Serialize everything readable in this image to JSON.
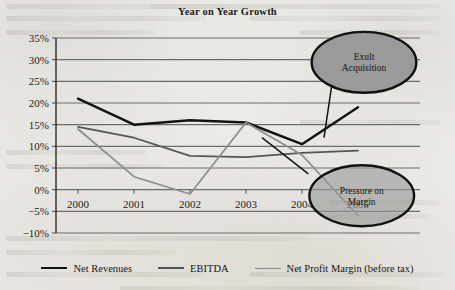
{
  "chart_data": {
    "type": "line",
    "title": "Year on Year Growth",
    "xlabel": "",
    "ylabel": "",
    "categories": [
      "2000",
      "2001",
      "2002",
      "2003",
      "2004",
      "2005"
    ],
    "ylim": [
      -10,
      35
    ],
    "ytick_labels": [
      "35%",
      "30%",
      "25%",
      "20%",
      "15%",
      "10%",
      "5%",
      "0%",
      "-5%",
      "-10%"
    ],
    "ytick_values": [
      35,
      30,
      25,
      20,
      15,
      10,
      5,
      0,
      -5,
      -10
    ],
    "ytick_step": 5,
    "grid": true,
    "legend_position": "bottom",
    "series": [
      {
        "name": "Net Revenues",
        "color": "#141414",
        "values": [
          21.0,
          15.0,
          16.0,
          15.5,
          10.5,
          19.0
        ]
      },
      {
        "name": "EBITDA",
        "color": "#555555",
        "values": [
          14.5,
          12.0,
          7.8,
          7.5,
          8.5,
          9.0
        ]
      },
      {
        "name": "Net Profit Margin (before tax)",
        "color": "#8d8d8d",
        "values": [
          14.0,
          3.0,
          -1.0,
          15.5,
          8.0,
          -6.0
        ]
      }
    ],
    "annotations": [
      {
        "id": "exult-acquisition",
        "lines": [
          "Exult",
          "Acquisition"
        ],
        "style": "solid",
        "center_pct": {
          "x": 0.8,
          "y": 0.215
        },
        "radius_pct": {
          "x": 0.115,
          "y": 0.105
        }
      },
      {
        "id": "pressure-on-margin",
        "lines": [
          "Pressure on",
          "Margin"
        ],
        "style": "translucent",
        "center_pct": {
          "x": 0.795,
          "y": 0.675
        },
        "radius_pct": {
          "x": 0.115,
          "y": 0.105
        }
      }
    ]
  },
  "legend": {
    "items": [
      {
        "label": "Net Revenues"
      },
      {
        "label": "EBITDA"
      },
      {
        "label": "Net Profit Margin (before tax)"
      }
    ]
  }
}
